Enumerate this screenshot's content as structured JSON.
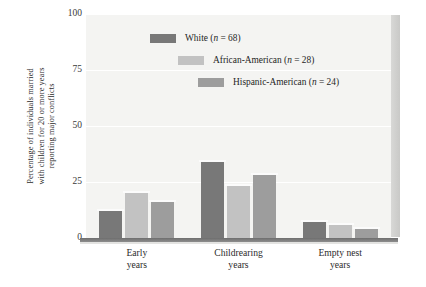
{
  "chart_data": {
    "type": "bar",
    "title": "",
    "xlabel": "",
    "ylabel": "Percentage of individuals married with children for 20 or more years reporting major conflicts",
    "ylabel_lines": [
      "Percentage of individuals married",
      "with children for 20 or more years",
      "reporting major conflicts"
    ],
    "categories": [
      "Early years",
      "Childrearing years",
      "Empty nest years"
    ],
    "category_lines": [
      [
        "Early",
        "years"
      ],
      [
        "Childrearing",
        "years"
      ],
      [
        "Empty nest",
        "years"
      ]
    ],
    "series": [
      {
        "name": "White",
        "n": 68,
        "label": "White (n = 68)",
        "color": "#787878",
        "values": [
          12,
          34,
          7
        ]
      },
      {
        "name": "African-American",
        "n": 28,
        "label": "African-American (n = 28)",
        "color": "#c2c2c2",
        "values": [
          20,
          23,
          6
        ]
      },
      {
        "name": "Hispanic-American",
        "n": 24,
        "label": "Hispanic-American (n = 24)",
        "color": "#9d9d9d",
        "values": [
          16,
          28,
          4
        ]
      }
    ],
    "yticks": [
      100,
      75,
      50,
      25,
      0
    ],
    "ylim": [
      0,
      100
    ],
    "grid": true,
    "legend_position": "top-center",
    "plot_background": "#f4f4f2"
  },
  "legend": {
    "items": [
      {
        "label": "White (",
        "italic": "n",
        "tail": " = 68)"
      },
      {
        "label": "African-American (",
        "italic": "n",
        "tail": " = 28)"
      },
      {
        "label": "Hispanic-American (",
        "italic": "n",
        "tail": " = 24)"
      }
    ]
  },
  "axis": {
    "tick_100": "100",
    "tick_75": "75",
    "tick_50": "50",
    "tick_25": "25",
    "tick_0": "0"
  }
}
